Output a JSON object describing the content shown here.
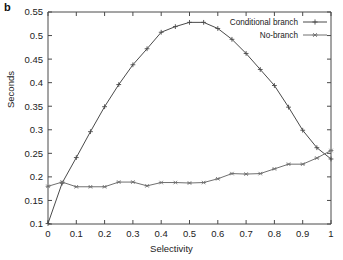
{
  "figure": {
    "panel_label": "b",
    "background_color": "#ffffff",
    "line_color": "#4a4a4a"
  },
  "chart_data": {
    "type": "line",
    "title": "",
    "subtitle": "",
    "xlabel": "Selectivity",
    "ylabel": "Seconds",
    "xlim": [
      0,
      1
    ],
    "ylim": [
      0.1,
      0.55
    ],
    "xticks": [
      "0",
      "0.1",
      "0.2",
      "0.3",
      "0.4",
      "0.5",
      "0.6",
      "0.7",
      "0.8",
      "0.9",
      "1"
    ],
    "xtick_values": [
      0,
      0.1,
      0.2,
      0.3,
      0.4,
      0.5,
      0.6,
      0.7,
      0.8,
      0.9,
      1
    ],
    "yticks": [
      "0.1",
      "0.15",
      "0.2",
      "0.25",
      "0.3",
      "0.35",
      "0.4",
      "0.45",
      "0.5",
      "0.55"
    ],
    "ytick_values": [
      0.1,
      0.15,
      0.2,
      0.25,
      0.3,
      0.35,
      0.4,
      0.45,
      0.5,
      0.55
    ],
    "grid": false,
    "legend_position": "top-right",
    "x": [
      0,
      0.05,
      0.1,
      0.15,
      0.2,
      0.25,
      0.3,
      0.35,
      0.4,
      0.45,
      0.5,
      0.55,
      0.6,
      0.65,
      0.7,
      0.75,
      0.8,
      0.85,
      0.9,
      0.95,
      1
    ],
    "series": [
      {
        "name": "Conditional branch",
        "marker": "plus",
        "color": "#4a4a4a",
        "values": [
          0.101,
          0.187,
          0.241,
          0.296,
          0.349,
          0.396,
          0.438,
          0.472,
          0.507,
          0.519,
          0.528,
          0.528,
          0.515,
          0.492,
          0.462,
          0.428,
          0.394,
          0.348,
          0.299,
          0.262,
          0.238
        ]
      },
      {
        "name": "No-branch",
        "marker": "star",
        "color": "#707070",
        "values": [
          0.18,
          0.189,
          0.179,
          0.179,
          0.179,
          0.189,
          0.189,
          0.181,
          0.188,
          0.188,
          0.187,
          0.188,
          0.196,
          0.207,
          0.206,
          0.207,
          0.217,
          0.227,
          0.227,
          0.24,
          0.256
        ]
      }
    ]
  }
}
